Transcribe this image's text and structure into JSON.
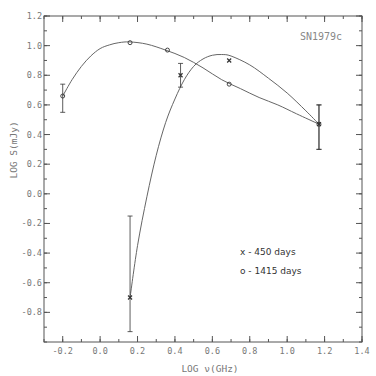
{
  "chart_data": {
    "type": "scatter",
    "title": "",
    "annotation": "SN1979c",
    "xlabel": "LOG ν(GHz)",
    "ylabel": "LOG S(mJy)",
    "xlim": [
      -0.3,
      1.4
    ],
    "ylim": [
      -1.0,
      1.2
    ],
    "xticks": [
      -0.2,
      0.0,
      0.2,
      0.4,
      0.6,
      0.8,
      1.0,
      1.2,
      1.4
    ],
    "xtick_labels": [
      "-0.2",
      "0.0",
      "0.2",
      "0.4",
      "0.6",
      "0.8",
      "1.0",
      "1.2",
      "1.4"
    ],
    "yticks": [
      1.2,
      1.0,
      0.8,
      0.6,
      0.4,
      0.2,
      0.0,
      -0.2,
      -0.4,
      -0.6,
      -0.8
    ],
    "ytick_labels": [
      "1.2",
      "1.0",
      "0.8",
      "0.6",
      "0.4",
      "0.2",
      "0.0",
      "-0.2",
      "-0.4",
      "-0.6",
      "-0.8"
    ],
    "grid": false,
    "legend_position": "lower right (inside)",
    "legend": [
      {
        "marker": "x",
        "label": "450 days"
      },
      {
        "marker": "o",
        "label": "1415 days"
      }
    ],
    "series": [
      {
        "name": "450 days",
        "marker": "x",
        "points": [
          {
            "x": 0.16,
            "y": -0.7,
            "yerr_low": -0.93,
            "yerr_high": -0.15
          },
          {
            "x": 0.43,
            "y": 0.8,
            "yerr_low": 0.72,
            "yerr_high": 0.88
          },
          {
            "x": 0.69,
            "y": 0.9
          },
          {
            "x": 1.17,
            "y": 0.47,
            "yerr_low": 0.3,
            "yerr_high": 0.6
          }
        ],
        "fit_curve": [
          [
            0.16,
            -0.7
          ],
          [
            0.2,
            -0.35
          ],
          [
            0.25,
            -0.02
          ],
          [
            0.3,
            0.26
          ],
          [
            0.35,
            0.48
          ],
          [
            0.4,
            0.64
          ],
          [
            0.45,
            0.77
          ],
          [
            0.5,
            0.86
          ],
          [
            0.55,
            0.91
          ],
          [
            0.6,
            0.935
          ],
          [
            0.65,
            0.94
          ],
          [
            0.7,
            0.93
          ],
          [
            0.8,
            0.87
          ],
          [
            0.9,
            0.78
          ],
          [
            1.0,
            0.68
          ],
          [
            1.1,
            0.56
          ],
          [
            1.17,
            0.47
          ]
        ]
      },
      {
        "name": "1415 days",
        "marker": "o",
        "points": [
          {
            "x": -0.2,
            "y": 0.66,
            "yerr_low": 0.55,
            "yerr_high": 0.74
          },
          {
            "x": 0.16,
            "y": 1.02
          },
          {
            "x": 0.36,
            "y": 0.97
          },
          {
            "x": 0.69,
            "y": 0.74
          },
          {
            "x": 1.17,
            "y": 0.47,
            "yerr_low": 0.3,
            "yerr_high": 0.6
          }
        ],
        "fit_curve": [
          [
            -0.2,
            0.66
          ],
          [
            -0.15,
            0.77
          ],
          [
            -0.1,
            0.86
          ],
          [
            -0.05,
            0.93
          ],
          [
            0.0,
            0.98
          ],
          [
            0.05,
            1.005
          ],
          [
            0.1,
            1.02
          ],
          [
            0.16,
            1.025
          ],
          [
            0.25,
            1.01
          ],
          [
            0.35,
            0.97
          ],
          [
            0.45,
            0.92
          ],
          [
            0.55,
            0.85
          ],
          [
            0.65,
            0.77
          ],
          [
            0.75,
            0.71
          ],
          [
            0.85,
            0.65
          ],
          [
            0.95,
            0.6
          ],
          [
            1.05,
            0.54
          ],
          [
            1.17,
            0.47
          ]
        ]
      }
    ]
  },
  "layout": {
    "plot": {
      "left": 44,
      "top": 16,
      "right": 362,
      "bottom": 342
    },
    "colors": {
      "axis": "#555555",
      "curve": "#666666",
      "marker": "#333333",
      "text": "#777777"
    }
  }
}
